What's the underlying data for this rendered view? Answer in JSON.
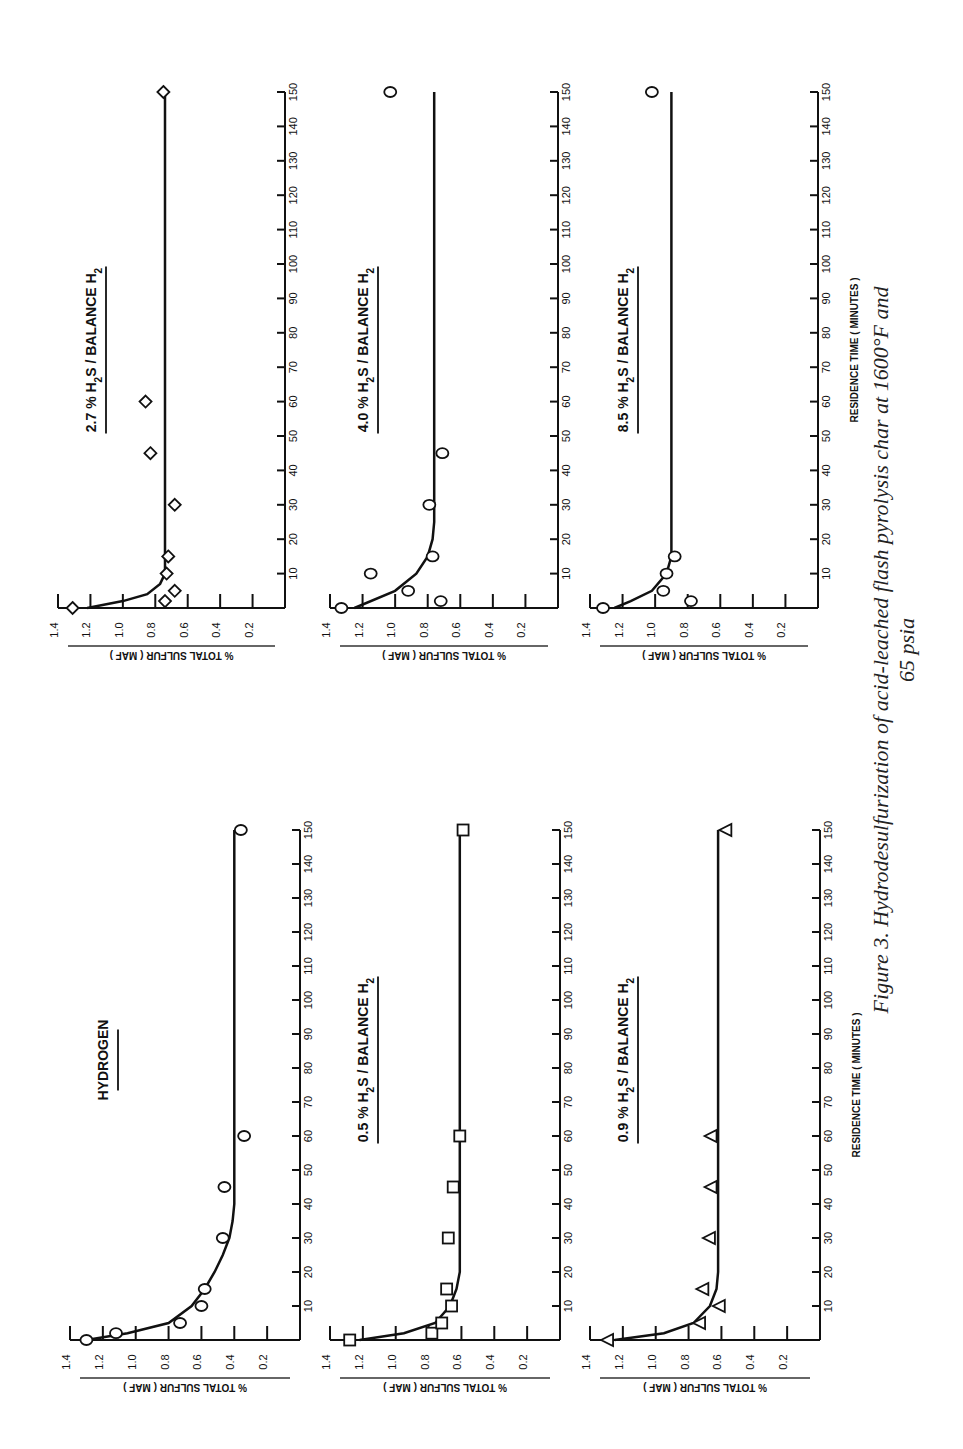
{
  "figure": {
    "caption_line1": "Figure 3.  Hydrodesulfurization of acid-leached flash pyrolysis char at 1600°F and",
    "caption_line2": "65 psia",
    "x_axis_label": "RESIDENCE TIME  ( MINUTES )",
    "y_axis_label": "% TOTAL SULFUR ( MAF )"
  },
  "chart_data": [
    {
      "type": "scatter",
      "title": "HYDROGEN",
      "panel": "bottom-left",
      "marker": "circle",
      "xlabel": "RESIDENCE TIME ( MINUTES )",
      "ylabel": "% TOTAL SULFUR ( MAF )",
      "xlim": [
        0,
        150
      ],
      "ylim": [
        0,
        1.4
      ],
      "xticks": [
        10,
        20,
        30,
        40,
        50,
        60,
        70,
        80,
        90,
        100,
        110,
        120,
        130,
        140,
        150
      ],
      "yticks": [
        0.2,
        0.4,
        0.6,
        0.8,
        1.0,
        1.2,
        1.4
      ],
      "points": [
        [
          0,
          1.3
        ],
        [
          2,
          1.12
        ],
        [
          5,
          0.73
        ],
        [
          10,
          0.6
        ],
        [
          15,
          0.58
        ],
        [
          30,
          0.47
        ],
        [
          45,
          0.46
        ],
        [
          60,
          0.34
        ],
        [
          150,
          0.36
        ]
      ],
      "fit_curve": [
        [
          0,
          1.3
        ],
        [
          2,
          1.05
        ],
        [
          5,
          0.8
        ],
        [
          10,
          0.66
        ],
        [
          15,
          0.58
        ],
        [
          20,
          0.52
        ],
        [
          25,
          0.47
        ],
        [
          30,
          0.43
        ],
        [
          35,
          0.41
        ],
        [
          40,
          0.4
        ],
        [
          150,
          0.4
        ]
      ]
    },
    {
      "type": "scatter",
      "title": "2.7 % H2S / BALANCE H2",
      "panel": "top-left",
      "marker": "diamond",
      "xlabel": "RESIDENCE TIME ( MINUTES )",
      "ylabel": "% TOTAL SULFUR ( MAF )",
      "xlim": [
        0,
        150
      ],
      "ylim": [
        0,
        1.4
      ],
      "xticks": [
        10,
        20,
        30,
        40,
        50,
        60,
        70,
        80,
        90,
        100,
        110,
        120,
        130,
        140,
        150
      ],
      "yticks": [
        0.2,
        0.4,
        0.6,
        0.8,
        1.0,
        1.2,
        1.4
      ],
      "points": [
        [
          0,
          1.31
        ],
        [
          2,
          0.74
        ],
        [
          5,
          0.68
        ],
        [
          10,
          0.73
        ],
        [
          15,
          0.72
        ],
        [
          30,
          0.68
        ],
        [
          45,
          0.83
        ],
        [
          60,
          0.86
        ],
        [
          150,
          0.75
        ]
      ],
      "fit_curve": [
        [
          0,
          1.22
        ],
        [
          2,
          1.0
        ],
        [
          4,
          0.85
        ],
        [
          7,
          0.77
        ],
        [
          10,
          0.74
        ],
        [
          15,
          0.74
        ],
        [
          150,
          0.74
        ]
      ]
    },
    {
      "type": "scatter",
      "title": "0.5 % H2S / BALANCE H2",
      "panel": "bottom-middle",
      "marker": "square",
      "xlabel": "RESIDENCE TIME ( MINUTES )",
      "ylabel": "% TOTAL SULFUR ( MAF )",
      "xlim": [
        0,
        150
      ],
      "ylim": [
        0,
        1.4
      ],
      "xticks": [
        10,
        20,
        30,
        40,
        50,
        60,
        70,
        80,
        90,
        100,
        110,
        120,
        130,
        140,
        150
      ],
      "yticks": [
        0.2,
        0.4,
        0.6,
        0.8,
        1.0,
        1.2,
        1.4
      ],
      "points": [
        [
          0,
          1.28
        ],
        [
          2,
          0.78
        ],
        [
          5,
          0.72
        ],
        [
          10,
          0.66
        ],
        [
          15,
          0.69
        ],
        [
          30,
          0.68
        ],
        [
          45,
          0.65
        ],
        [
          60,
          0.61
        ],
        [
          150,
          0.59
        ]
      ],
      "fit_curve": [
        [
          0,
          1.22
        ],
        [
          2,
          0.95
        ],
        [
          5,
          0.76
        ],
        [
          10,
          0.67
        ],
        [
          15,
          0.63
        ],
        [
          20,
          0.61
        ],
        [
          150,
          0.61
        ]
      ]
    },
    {
      "type": "scatter",
      "title": "4.0 % H2S / BALANCE H2",
      "panel": "top-middle",
      "marker": "circle",
      "xlabel": "RESIDENCE TIME ( MINUTES )",
      "ylabel": "% TOTAL SULFUR ( MAF )",
      "xlim": [
        0,
        150
      ],
      "ylim": [
        0,
        1.4
      ],
      "xticks": [
        10,
        20,
        30,
        40,
        50,
        60,
        70,
        80,
        90,
        100,
        110,
        120,
        130,
        140,
        150
      ],
      "yticks": [
        0.2,
        0.4,
        0.6,
        0.8,
        1.0,
        1.2,
        1.4
      ],
      "points": [
        [
          0,
          1.33
        ],
        [
          2,
          0.72
        ],
        [
          5,
          0.92
        ],
        [
          10,
          1.15
        ],
        [
          15,
          0.77
        ],
        [
          30,
          0.79
        ],
        [
          45,
          0.71
        ],
        [
          150,
          1.03
        ]
      ],
      "fit_curve": [
        [
          0,
          1.25
        ],
        [
          5,
          1.0
        ],
        [
          10,
          0.87
        ],
        [
          15,
          0.8
        ],
        [
          20,
          0.77
        ],
        [
          25,
          0.76
        ],
        [
          150,
          0.76
        ]
      ]
    },
    {
      "type": "scatter",
      "title": "0.9 % H2S / BALANCE H2",
      "panel": "bottom-right",
      "marker": "triangle",
      "xlabel": "RESIDENCE TIME ( MINUTES )",
      "ylabel": "% TOTAL SULFUR ( MAF )",
      "xlim": [
        0,
        150
      ],
      "ylim": [
        0,
        1.4
      ],
      "xticks": [
        10,
        20,
        30,
        40,
        50,
        60,
        70,
        80,
        90,
        100,
        110,
        120,
        130,
        140,
        150
      ],
      "yticks": [
        0.2,
        0.4,
        0.6,
        0.8,
        1.0,
        1.2,
        1.4
      ],
      "points": [
        [
          0,
          1.29
        ],
        [
          5,
          0.73
        ],
        [
          10,
          0.61
        ],
        [
          15,
          0.71
        ],
        [
          30,
          0.67
        ],
        [
          45,
          0.66
        ],
        [
          60,
          0.66
        ],
        [
          150,
          0.57
        ]
      ],
      "fit_curve": [
        [
          0,
          1.25
        ],
        [
          2,
          0.95
        ],
        [
          5,
          0.77
        ],
        [
          10,
          0.67
        ],
        [
          15,
          0.63
        ],
        [
          20,
          0.62
        ],
        [
          150,
          0.62
        ]
      ]
    },
    {
      "type": "scatter",
      "title": "8.5 % H2S / BALANCE H2",
      "panel": "top-right",
      "marker": "circle",
      "xlabel": "RESIDENCE TIME ( MINUTES )",
      "ylabel": "% TOTAL SULFUR ( MAF )",
      "xlim": [
        0,
        150
      ],
      "ylim": [
        0,
        1.4
      ],
      "xticks": [
        10,
        20,
        30,
        40,
        50,
        60,
        70,
        80,
        90,
        100,
        110,
        120,
        130,
        140,
        150
      ],
      "yticks": [
        0.2,
        0.4,
        0.6,
        0.8,
        1.0,
        1.2,
        1.4
      ],
      "points": [
        [
          0,
          1.32
        ],
        [
          2,
          0.78
        ],
        [
          5,
          0.95
        ],
        [
          10,
          0.93
        ],
        [
          15,
          0.88
        ],
        [
          150,
          1.02
        ]
      ],
      "fit_curve": [
        [
          0,
          1.25
        ],
        [
          2,
          1.15
        ],
        [
          5,
          1.02
        ],
        [
          10,
          0.93
        ],
        [
          15,
          0.9
        ],
        [
          20,
          0.9
        ],
        [
          150,
          0.9
        ]
      ]
    }
  ]
}
